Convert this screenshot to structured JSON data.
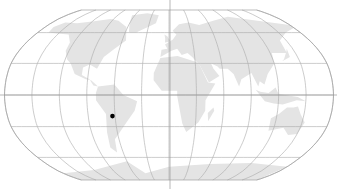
{
  "map": {
    "projection": "robinson",
    "background": "#ffffff",
    "land_color": "#e4e4e4",
    "graticule_color": "#a9a9a9",
    "graticule_step_deg": 30,
    "marker": {
      "label": "",
      "color": "#000000",
      "lon": -63,
      "lat": -20
    }
  }
}
